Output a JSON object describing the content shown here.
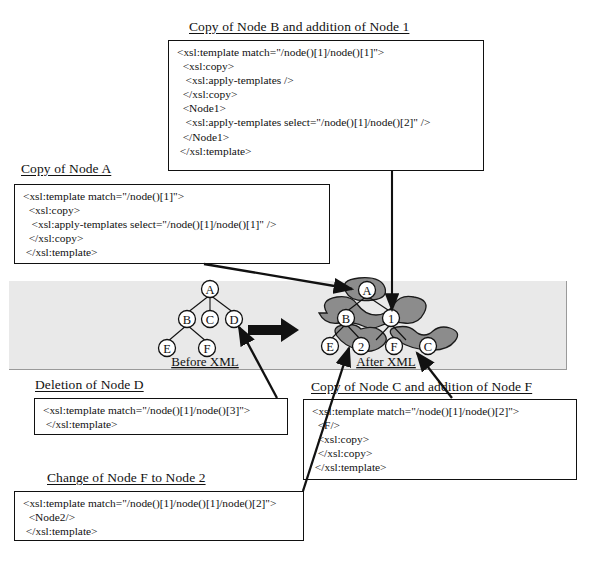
{
  "figure": {
    "background_band_color": "#e9e9e9",
    "blob_color": "#8c8c8c",
    "line_color": "#111111"
  },
  "boxes": [
    {
      "id": "copy-node-b",
      "caption": "Copy of Node B and addition of Node 1",
      "lines": [
        "<xsl:template match=\"/node()[1]/node()[1]\">",
        "  <xsl:copy>",
        "   <xsl:apply-templates />",
        "  </xsl:copy>",
        "  <Node1>",
        "   <xsl:apply-templates select=\"/node()[1]/node()[2]\" />",
        "  </Node1>",
        " </xsl:template>"
      ]
    },
    {
      "id": "copy-node-a",
      "caption": "Copy of Node A",
      "lines": [
        "<xsl:template match=\"/node()[1]\">",
        "  <xsl:copy>",
        "   <xsl:apply-templates select=\"/node()[1]/node()[1]\" />",
        "  </xsl:copy>",
        " </xsl:template>"
      ]
    },
    {
      "id": "deletion-node-d",
      "caption": "Deletion of Node D",
      "lines": [
        "<xsl:template match=\"/node()[1]/node()[3]\">",
        " </xsl:template>"
      ]
    },
    {
      "id": "copy-node-c",
      "caption": "Copy of Node C and addition of Node F",
      "lines": [
        "<xsl:template match=\"/node()[1]/node()[2]\">",
        "  <F/>",
        "  <xsl:copy>",
        "  </xsl:copy>",
        " </xsl:template>"
      ]
    },
    {
      "id": "change-node-f",
      "caption": "Change of Node F to Node 2",
      "lines": [
        "<xsl:template match=\"/node()[1]/node()[1]/node()[2]\">",
        "  <Node2/>",
        " </xsl:template>"
      ]
    }
  ],
  "trees": {
    "before": {
      "caption": "Before XML",
      "nodes": [
        {
          "id": "A",
          "label": "A"
        },
        {
          "id": "B",
          "label": "B"
        },
        {
          "id": "C",
          "label": "C"
        },
        {
          "id": "D",
          "label": "D"
        },
        {
          "id": "E",
          "label": "E"
        },
        {
          "id": "F",
          "label": "F"
        }
      ],
      "edges": [
        [
          "A",
          "B"
        ],
        [
          "A",
          "C"
        ],
        [
          "A",
          "D"
        ],
        [
          "B",
          "E"
        ],
        [
          "B",
          "F"
        ]
      ]
    },
    "after": {
      "caption": "After XML",
      "nodes": [
        {
          "id": "A",
          "label": "A"
        },
        {
          "id": "B",
          "label": "B"
        },
        {
          "id": "1",
          "label": "1"
        },
        {
          "id": "E",
          "label": "E"
        },
        {
          "id": "2",
          "label": "2"
        },
        {
          "id": "F",
          "label": "F"
        },
        {
          "id": "C",
          "label": "C"
        }
      ],
      "edges": [
        [
          "A",
          "B"
        ],
        [
          "A",
          "1"
        ],
        [
          "B",
          "E"
        ],
        [
          "B",
          "2"
        ],
        [
          "1",
          "F"
        ],
        [
          "1",
          "C"
        ]
      ]
    }
  },
  "transform_arrow": "right-arrow"
}
